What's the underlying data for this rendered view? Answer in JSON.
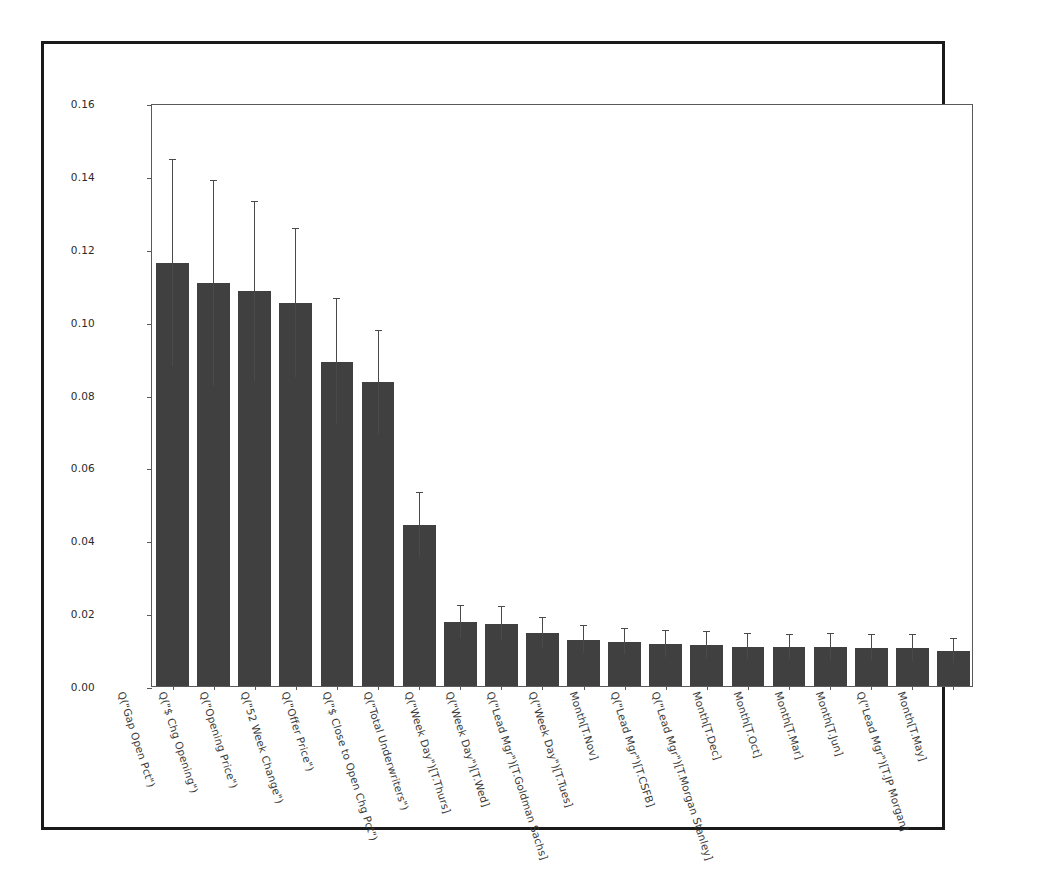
{
  "figure": {
    "background_color": "#ffffff",
    "frame_color": "#1a1a1a",
    "bar_color": "#404040",
    "errorbar_color": "#4a4a4a",
    "axis_color": "#5a5a5a"
  },
  "chart_data": {
    "type": "bar",
    "title": "",
    "xlabel": "",
    "ylabel": "",
    "ylim": [
      0.0,
      0.16
    ],
    "grid": false,
    "legend": null,
    "ytick_labels": [
      "0.00",
      "0.02",
      "0.04",
      "0.06",
      "0.08",
      "0.10",
      "0.12",
      "0.14",
      "0.16"
    ],
    "ytick_values": [
      0.0,
      0.02,
      0.04,
      0.06,
      0.08,
      0.1,
      0.12,
      0.14,
      0.16
    ],
    "categories": [
      "Q(\"Gap Open Pct\")",
      "Q(\"$ Chg Opening\")",
      "Q(\"Opening Price\")",
      "Q(\"52 Week Change\")",
      "Q(\"Offer Price\")",
      "Q(\"$ Close to Open Chg Pct\")",
      "Q(\"Total Underwriters\")",
      "Q(\"Week Day\")[T.Thurs]",
      "Q(\"Week Day\")[T.Wed]",
      "Q(\"Lead Mgr\")[T.Goldman Sachs]",
      "Q(\"Week Day\")[T.Tues]",
      "Month[T.Nov]",
      "Q(\"Lead Mgr\")[T.CSFB]",
      "Q(\"Lead Mgr\")[T.Morgan Stanley]",
      "Month[T.Dec]",
      "Month[T.Oct]",
      "Month[T.Mar]",
      "Month[T.Jun]",
      "Q(\"Lead Mgr\")[T.JP Morgan]",
      "Month[T.May]"
    ],
    "values": [
      0.116,
      0.1105,
      0.1083,
      0.105,
      0.089,
      0.0833,
      0.0442,
      0.0175,
      0.017,
      0.0145,
      0.0127,
      0.0122,
      0.0115,
      0.0113,
      0.0108,
      0.0107,
      0.0107,
      0.0105,
      0.0104,
      0.0096
    ],
    "errors": [
      0.0283,
      0.0281,
      0.0245,
      0.0203,
      0.0172,
      0.014,
      0.0087,
      0.0044,
      0.0047,
      0.0041,
      0.0037,
      0.0035,
      0.0036,
      0.0035,
      0.0035,
      0.0033,
      0.0035,
      0.0034,
      0.0035,
      0.0034
    ]
  }
}
